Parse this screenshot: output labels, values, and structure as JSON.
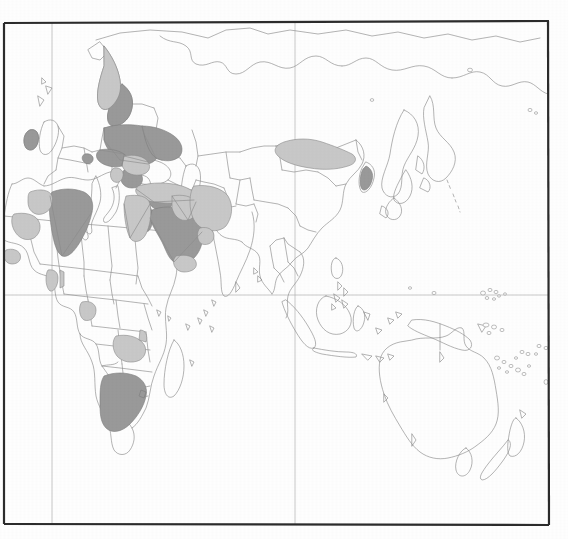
{
  "map": {
    "title": "World map (Eastern Hemisphere) choropleth",
    "projection": "equirectangular",
    "frame": {
      "left": 4,
      "top": 22,
      "right": 549,
      "bottom": 525,
      "stroke": "#2b2b2b",
      "stroke_width": 2.2
    },
    "graticule": {
      "visible": true,
      "stroke": "#b0b0b0",
      "stroke_width": 0.7,
      "meridians_x": [
        52,
        295
      ],
      "parallels_y": [
        295,
        525
      ]
    },
    "colors": {
      "background": "#ffffff",
      "ocean": "#ffffff",
      "land_fill": "#ffffff",
      "country_outline": "#8c8c8c",
      "shade_dark": "#9a9a9a",
      "shade_light": "#c9c9c9",
      "frame": "#2b2b2b"
    },
    "legend": {
      "visible": false,
      "classes": [
        {
          "key": "shade_dark",
          "color": "#9a9a9a",
          "label": "High"
        },
        {
          "key": "shade_light",
          "color": "#c9c9c9",
          "label": "Low"
        },
        {
          "key": "unshaded",
          "color": "#ffffff",
          "label": "No data"
        }
      ]
    },
    "shaded_countries": [
      {
        "name": "Finland",
        "shade": "dark"
      },
      {
        "name": "Norway",
        "shade": "light"
      },
      {
        "name": "Estonia",
        "shade": "dark"
      },
      {
        "name": "Latvia",
        "shade": "dark"
      },
      {
        "name": "Lithuania",
        "shade": "dark"
      },
      {
        "name": "Belarus",
        "shade": "dark"
      },
      {
        "name": "Poland",
        "shade": "dark"
      },
      {
        "name": "Western Russia",
        "shade": "dark"
      },
      {
        "name": "Czech Republic",
        "shade": "dark"
      },
      {
        "name": "Slovakia",
        "shade": "dark"
      },
      {
        "name": "Austria",
        "shade": "dark"
      },
      {
        "name": "Hungary",
        "shade": "dark"
      },
      {
        "name": "Switzerland",
        "shade": "dark"
      },
      {
        "name": "Romania",
        "shade": "light"
      },
      {
        "name": "Bulgaria",
        "shade": "dark"
      },
      {
        "name": "Serbia",
        "shade": "light"
      },
      {
        "name": "Ireland",
        "shade": "dark"
      },
      {
        "name": "Turkey",
        "shade": "light"
      },
      {
        "name": "Syria",
        "shade": "dark"
      },
      {
        "name": "Lebanon",
        "shade": "dark"
      },
      {
        "name": "Israel",
        "shade": "dark"
      },
      {
        "name": "Jordan",
        "shade": "dark"
      },
      {
        "name": "Iraq",
        "shade": "light"
      },
      {
        "name": "Iran",
        "shade": "light"
      },
      {
        "name": "Saudi Arabia",
        "shade": "dark"
      },
      {
        "name": "Oman",
        "shade": "light"
      },
      {
        "name": "Yemen",
        "shade": "light"
      },
      {
        "name": "Egypt",
        "shade": "light"
      },
      {
        "name": "Algeria",
        "shade": "dark"
      },
      {
        "name": "Morocco",
        "shade": "light"
      },
      {
        "name": "Mauritania",
        "shade": "light"
      },
      {
        "name": "Senegal",
        "shade": "light"
      },
      {
        "name": "Ghana",
        "shade": "light"
      },
      {
        "name": "Benin",
        "shade": "light"
      },
      {
        "name": "Gabon",
        "shade": "light"
      },
      {
        "name": "Zambia",
        "shade": "light"
      },
      {
        "name": "South Africa",
        "shade": "dark"
      },
      {
        "name": "Mongolia",
        "shade": "light"
      },
      {
        "name": "South Korea",
        "shade": "dark"
      }
    ],
    "unshaded_regions": [
      "Sweden",
      "United Kingdom",
      "France",
      "Spain",
      "Portugal",
      "Germany",
      "Italy",
      "Greece",
      "Ukraine",
      "Kazakhstan",
      "China",
      "India",
      "Pakistan",
      "Afghanistan",
      "Myanmar",
      "Thailand",
      "Vietnam",
      "Indonesia",
      "Philippines",
      "Japan",
      "Australia",
      "New Zealand",
      "Papua New Guinea",
      "Madagascar",
      "Libya",
      "Sudan",
      "Chad",
      "Niger",
      "Mali",
      "Nigeria",
      "Ethiopia",
      "Kenya",
      "Tanzania",
      "Angola",
      "Namibia",
      "Botswana",
      "Zimbabwe",
      "Mozambique",
      "Eastern Russia / Siberia"
    ]
  }
}
